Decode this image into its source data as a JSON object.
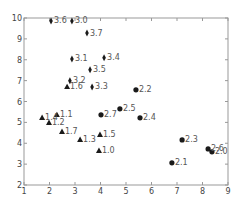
{
  "chart_data": {
    "type": "scatter",
    "title": "",
    "xlabel": "",
    "ylabel": "",
    "xlim": [
      1,
      9
    ],
    "ylim": [
      2,
      10
    ],
    "grid": false,
    "x_ticks": [
      "1",
      "2",
      "3",
      "4",
      "5",
      "6",
      "7",
      "8",
      "9"
    ],
    "y_ticks": [
      "2",
      "3",
      "4",
      "5",
      "6",
      "7",
      "8",
      "9",
      "10"
    ],
    "colors": {
      "marker": "#1a1a1a",
      "axis": "#999999",
      "text": "#555555"
    },
    "series": [
      {
        "name": "group-1",
        "marker": "triangle",
        "points": [
          {
            "label": "1.0",
            "x": 3.94,
            "y": 3.64
          },
          {
            "label": "1.1",
            "x": 2.29,
            "y": 5.36
          },
          {
            "label": "1.2",
            "x": 1.98,
            "y": 4.98
          },
          {
            "label": "1.3",
            "x": 3.2,
            "y": 4.17
          },
          {
            "label": "1.4",
            "x": 1.71,
            "y": 5.22
          },
          {
            "label": "1.5",
            "x": 3.98,
            "y": 4.41
          },
          {
            "label": "1.6",
            "x": 2.69,
            "y": 6.7
          },
          {
            "label": "1.7",
            "x": 2.49,
            "y": 4.55
          }
        ]
      },
      {
        "name": "group-2",
        "marker": "circle",
        "points": [
          {
            "label": "2.0",
            "x": 8.37,
            "y": 3.59
          },
          {
            "label": "2.1",
            "x": 6.8,
            "y": 3.06
          },
          {
            "label": "2.2",
            "x": 5.39,
            "y": 6.56
          },
          {
            "label": "2.3",
            "x": 7.2,
            "y": 4.16
          },
          {
            "label": "2.4",
            "x": 5.55,
            "y": 5.22
          },
          {
            "label": "2.5",
            "x": 4.76,
            "y": 5.65
          },
          {
            "label": "2.6",
            "x": 8.22,
            "y": 3.73
          },
          {
            "label": "2.7",
            "x": 4.02,
            "y": 5.36
          }
        ]
      },
      {
        "name": "group-3",
        "marker": "thin-diamond",
        "points": [
          {
            "label": "3.0",
            "x": 2.88,
            "y": 9.86
          },
          {
            "label": "3.1",
            "x": 2.88,
            "y": 8.04
          },
          {
            "label": "3.2",
            "x": 2.8,
            "y": 7.0
          },
          {
            "label": "3.3",
            "x": 3.67,
            "y": 6.7
          },
          {
            "label": "3.4",
            "x": 4.14,
            "y": 8.09
          },
          {
            "label": "3.5",
            "x": 3.59,
            "y": 7.52
          },
          {
            "label": "3.6",
            "x": 2.06,
            "y": 9.86
          },
          {
            "label": "3.7",
            "x": 3.47,
            "y": 9.28
          }
        ]
      }
    ]
  }
}
